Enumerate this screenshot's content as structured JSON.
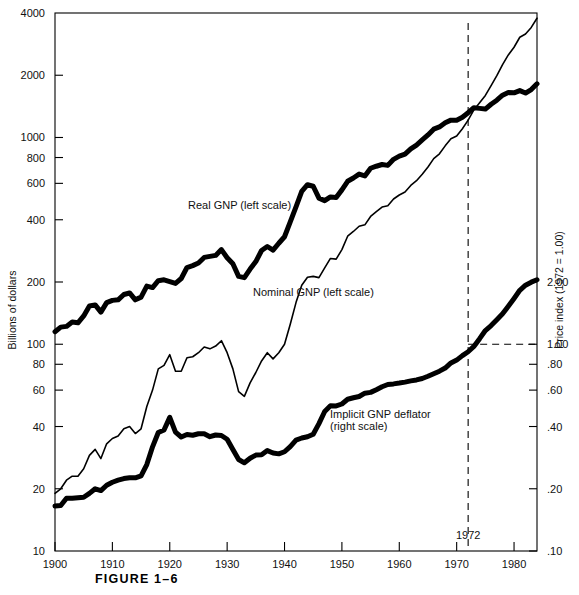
{
  "figure": {
    "caption": "FIGURE 1–6",
    "left_axis_title": "Billions of dollars",
    "right_axis_title": "Price index (1972 = 1.00)"
  },
  "annotations": {
    "marker_year_label": "1972",
    "marker_year_value": 1972,
    "marker_index_value": 1.0
  },
  "chart_data": {
    "type": "line",
    "title": "FIGURE 1–6",
    "xlabel": "",
    "ylabel": "Billions of dollars",
    "y2label": "Price index (1972 = 1.00)",
    "yscale": "log",
    "y2scale": "log",
    "ylim": [
      10,
      4000
    ],
    "y2lim": [
      0.1,
      4.0
    ],
    "xlim": [
      1900,
      1984
    ],
    "grid": false,
    "legend": "inline-annotations",
    "yticks": [
      10,
      20,
      40,
      60,
      80,
      100,
      200,
      400,
      600,
      800,
      1000,
      2000,
      4000
    ],
    "ytick_labels": [
      "10",
      "20",
      "40",
      "60",
      "80",
      "100",
      "200",
      "400",
      "600",
      "800",
      "1000",
      "2000",
      "4000"
    ],
    "y2ticks": [
      0.1,
      0.2,
      0.4,
      0.6,
      0.8,
      1.0,
      2.0
    ],
    "y2tick_labels": [
      ".10",
      ".20",
      ".40",
      ".60",
      ".80",
      "1.00",
      "2.00"
    ],
    "xticks": [
      1900,
      1910,
      1920,
      1930,
      1940,
      1950,
      1960,
      1970,
      1980
    ],
    "xtick_labels": [
      "1900",
      "1910",
      "1920",
      "1930",
      "1940",
      "1950",
      "1960",
      "1970",
      "1980"
    ],
    "x": [
      1900,
      1901,
      1902,
      1903,
      1904,
      1905,
      1906,
      1907,
      1908,
      1909,
      1910,
      1911,
      1912,
      1913,
      1914,
      1915,
      1916,
      1917,
      1918,
      1919,
      1920,
      1921,
      1922,
      1923,
      1924,
      1925,
      1926,
      1927,
      1928,
      1929,
      1930,
      1931,
      1932,
      1933,
      1934,
      1935,
      1936,
      1937,
      1938,
      1939,
      1940,
      1941,
      1942,
      1943,
      1944,
      1945,
      1946,
      1947,
      1948,
      1949,
      1950,
      1951,
      1952,
      1953,
      1954,
      1955,
      1956,
      1957,
      1958,
      1959,
      1960,
      1961,
      1962,
      1963,
      1964,
      1965,
      1966,
      1967,
      1968,
      1969,
      1970,
      1971,
      1972,
      1973,
      1974,
      1975,
      1976,
      1977,
      1978,
      1979,
      1980,
      1981,
      1982,
      1983,
      1984
    ],
    "series": [
      {
        "name": "Real GNP (left scale)",
        "label": "Real GNP (left scale)",
        "scale": "left",
        "style": "thick-solid",
        "units": "billions of 1972 dollars",
        "values": [
          115,
          121,
          122,
          128,
          127,
          137,
          153,
          155,
          143,
          159,
          163,
          164,
          174,
          177,
          164,
          169,
          191,
          188,
          203,
          205,
          201,
          197,
          208,
          235,
          240,
          247,
          263,
          266,
          269,
          287,
          262,
          245,
          213,
          210,
          231,
          251,
          284,
          297,
          285,
          308,
          331,
          391,
          462,
          548,
          591,
          581,
          509,
          495,
          516,
          513,
          558,
          614,
          637,
          665,
          652,
          710,
          726,
          740,
          733,
          784,
          812,
          831,
          881,
          919,
          973,
          1029,
          1097,
          1125,
          1178,
          1213,
          1212,
          1252,
          1318,
          1393,
          1383,
          1372,
          1448,
          1515,
          1601,
          1651,
          1644,
          1685,
          1640,
          1706,
          1818
        ]
      },
      {
        "name": "Nominal GNP (left scale)",
        "label": "Nominal GNP (left scale)",
        "scale": "left",
        "style": "thin-solid",
        "units": "billions of current dollars",
        "values": [
          19,
          20,
          22,
          23,
          23,
          25,
          29,
          31,
          28,
          33,
          35,
          36,
          39,
          40,
          37,
          39,
          50,
          60,
          76,
          79,
          89,
          74,
          74,
          86,
          87,
          91,
          97,
          95,
          98,
          104,
          91,
          76,
          59,
          56,
          65,
          73,
          83,
          91,
          85,
          91,
          100,
          125,
          159,
          193,
          211,
          213,
          210,
          234,
          260,
          258,
          287,
          333,
          351,
          372,
          378,
          415,
          438,
          461,
          468,
          504,
          527,
          545,
          586,
          618,
          664,
          720,
          790,
          834,
          911,
          985,
          1016,
          1103,
          1213,
          1359,
          1473,
          1598,
          1783,
          1991,
          2250,
          2508,
          2732,
          3053,
          3166,
          3406,
          3772
        ]
      },
      {
        "name": "Implicit GNP deflator (right scale)",
        "label": "Implicit GNP deflator (right scale)",
        "scale": "right",
        "style": "thick-solid",
        "units": "index, 1972 = 1.00",
        "values": [
          0.165,
          0.166,
          0.18,
          0.18,
          0.181,
          0.182,
          0.19,
          0.2,
          0.196,
          0.208,
          0.215,
          0.22,
          0.224,
          0.226,
          0.226,
          0.231,
          0.262,
          0.319,
          0.374,
          0.385,
          0.443,
          0.376,
          0.356,
          0.366,
          0.363,
          0.369,
          0.369,
          0.357,
          0.364,
          0.362,
          0.347,
          0.31,
          0.277,
          0.267,
          0.281,
          0.291,
          0.292,
          0.306,
          0.298,
          0.295,
          0.302,
          0.32,
          0.344,
          0.352,
          0.357,
          0.367,
          0.413,
          0.473,
          0.504,
          0.503,
          0.514,
          0.542,
          0.551,
          0.559,
          0.58,
          0.585,
          0.603,
          0.623,
          0.639,
          0.643,
          0.649,
          0.656,
          0.665,
          0.672,
          0.683,
          0.7,
          0.72,
          0.741,
          0.767,
          0.812,
          0.838,
          0.881,
          0.92,
          0.976,
          1.064,
          1.165,
          1.232,
          1.314,
          1.404,
          1.527,
          1.666,
          1.824,
          1.93,
          1.996,
          2.05
        ]
      }
    ]
  }
}
